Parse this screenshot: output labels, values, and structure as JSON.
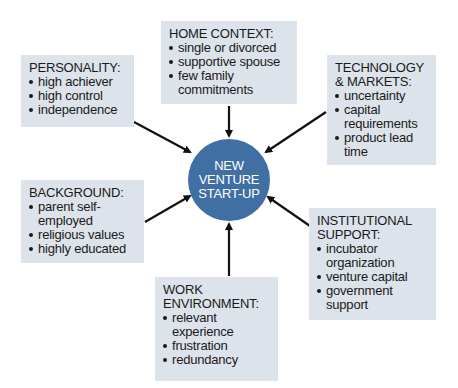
{
  "center": {
    "label": "NEW\nVENTURE\nSTART-UP",
    "color": "#3f6fa3"
  },
  "box_color": "#dde3ea",
  "factors": {
    "home_context": {
      "title": "HOME CONTEXT:",
      "items": [
        "single or divorced",
        "supportive spouse",
        "few family commitments"
      ]
    },
    "personality": {
      "title": "PERSONALITY:",
      "items": [
        "high achiever",
        "high control",
        "independence"
      ]
    },
    "technology_markets": {
      "title": "TECHNOLOGY\n& MARKETS:",
      "items": [
        "uncertainty",
        "capital requirements",
        "product lead time"
      ]
    },
    "background": {
      "title": "BACKGROUND:",
      "items": [
        "parent self-employed",
        "religious values",
        "highly educated"
      ]
    },
    "work_environment": {
      "title": "WORK\nENVIRONMENT:",
      "items": [
        "relevant experience",
        "frustration",
        "redundancy"
      ]
    },
    "institutional_support": {
      "title": "INSTITUTIONAL\nSUPPORT:",
      "items": [
        "incubator organization",
        "venture capital",
        "government support"
      ]
    }
  }
}
